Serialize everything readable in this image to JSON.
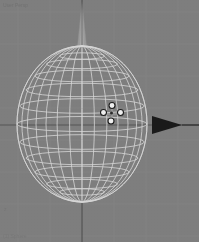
{
  "app": {
    "kind": "3d-modeling-viewport",
    "window_title": "3D View",
    "header_text": "User Persp",
    "footer_text": "(1) Sphere",
    "corner_text": "z"
  },
  "viewport": {
    "width": 199,
    "height": 242,
    "background_color": "#7e7e7e",
    "grid_color": "#8a8a8a",
    "axis_color": "#3a3a3a",
    "wire_color": "#d8d8d8",
    "gizmo_handle_fill": "#f0f0f0",
    "gizmo_handle_stroke": "#1c1c1c",
    "arrow_color": "#1a1a1a",
    "cone_color": "#9a9a9a"
  },
  "grid": {
    "vertical_x": [
      18,
      50,
      82,
      114,
      146,
      178
    ],
    "horizontal_y": [
      12,
      44,
      76,
      108,
      140,
      172,
      204,
      236
    ],
    "origin_x": 82,
    "origin_y": 125
  },
  "object": {
    "name": "Sphere",
    "type": "uv-sphere-wireframe",
    "center_x": 82,
    "center_y": 124,
    "radius_x": 65,
    "radius_y": 78,
    "meridians": 16,
    "latitude_rings": 11
  },
  "manipulator": {
    "name": "transform-manipulator",
    "center_x": 112,
    "center_y": 114,
    "handle_count": 4,
    "handle_radius": 3.2,
    "arm_length": 9
  },
  "axis_cone": {
    "name": "z-axis-cone",
    "tip_x": 82,
    "tip_y": 2,
    "base_y": 46,
    "half_width": 4
  },
  "axis_arrow": {
    "name": "x-axis-arrow",
    "tail_x": 152,
    "tip_x": 182,
    "y": 125,
    "half_height": 9,
    "line_end_x": 199
  }
}
